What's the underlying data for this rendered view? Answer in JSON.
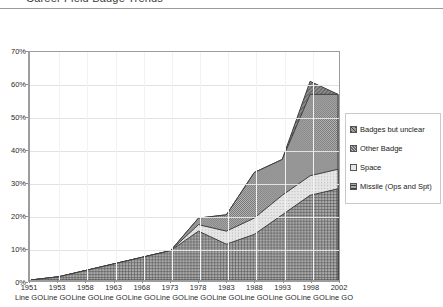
{
  "title": "Career Field Badge Trends",
  "chart_data": {
    "type": "area",
    "stacked": true,
    "title": "Career Field Badge Trends",
    "xlabel": "",
    "ylabel": "",
    "ylim": [
      0,
      70
    ],
    "ytick_labels": [
      "0%",
      "10%",
      "20%",
      "30%",
      "40%",
      "50%",
      "60%",
      "70%"
    ],
    "ytick_values": [
      0,
      10,
      20,
      30,
      40,
      50,
      60,
      70
    ],
    "grid": true,
    "legend_position": "right",
    "categories": [
      "1951",
      "1953",
      "1958",
      "1963",
      "1968",
      "1973",
      "1978",
      "1983",
      "1988",
      "1993",
      "1998",
      "2002"
    ],
    "category_sublabel": "Line GO",
    "category_sublabels": [
      "Line GO",
      "Line GO",
      "Line GO",
      "Line GO",
      "Line GO",
      "Line GO",
      "Line GO",
      "Line GO",
      "Line GO",
      "Line GO",
      "Line GO",
      "Line GO"
    ],
    "series": [
      {
        "name": "Missile (Ops and Spt)",
        "pattern": "fine-grid",
        "color": "#7a7a7a",
        "values": [
          0,
          1,
          3,
          5,
          7,
          9,
          15,
          11,
          14,
          20,
          26,
          28
        ]
      },
      {
        "name": "Space",
        "pattern": "light-dots",
        "color": "#d9d9d9",
        "values": [
          0,
          0,
          0,
          0,
          0,
          0,
          2,
          4,
          5,
          6,
          6,
          6
        ]
      },
      {
        "name": "Other Badge",
        "pattern": "dense-crosshatch",
        "color": "#8f8f8f",
        "values": [
          0,
          0,
          0,
          0,
          0,
          0,
          2,
          5,
          14,
          11,
          25,
          23
        ]
      },
      {
        "name": "Badges but unclear",
        "pattern": "diagonal-hatch",
        "color": "#6a6a6a",
        "values": [
          0,
          0,
          0,
          0,
          0,
          0,
          0,
          0,
          0,
          0,
          4,
          0
        ]
      }
    ],
    "cumulative_totals": [
      0,
      1,
      3,
      5,
      7,
      9,
      19,
      20,
      33,
      37,
      61,
      57
    ],
    "legend_entries": [
      "Badges but unclear",
      "Other Badge",
      "Space",
      "Missile (Ops and Spt)"
    ]
  }
}
